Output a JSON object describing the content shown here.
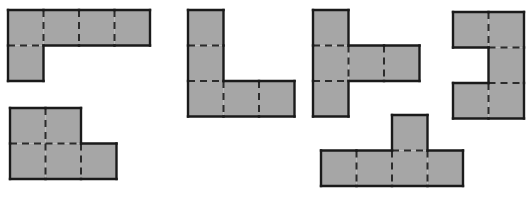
{
  "figure": {
    "background_color": "#ffffff",
    "cell_fill_color": "#a6a6a6",
    "outline_color": "#1a1a1a",
    "interior_line_color": "#2b2b2b",
    "outline_width": 2.4,
    "interior_line_width": 2.0,
    "interior_dash_pattern": "7 5",
    "cell_size": 35.5,
    "canvas": {
      "width": 532,
      "height": 197
    },
    "shape_count": 5,
    "total_cells": 25,
    "shapes": [
      {
        "id": "shape-1",
        "name": "L-pentomino-top-left",
        "label": "Shape 1",
        "cell_count": 5,
        "origin_x": 8,
        "origin_y": 10,
        "grid_cols": 4,
        "grid_rows": 2,
        "cells": [
          {
            "col": 0,
            "row": 0
          },
          {
            "col": 1,
            "row": 0
          },
          {
            "col": 2,
            "row": 0
          },
          {
            "col": 3,
            "row": 0
          },
          {
            "col": 0,
            "row": 1
          }
        ]
      },
      {
        "id": "shape-2",
        "name": "P-pentomino-bottom-left",
        "label": "Shape 2",
        "cell_count": 5,
        "origin_x": 10,
        "origin_y": 108,
        "grid_cols": 3,
        "grid_rows": 2,
        "cells": [
          {
            "col": 0,
            "row": 0
          },
          {
            "col": 1,
            "row": 0
          },
          {
            "col": 0,
            "row": 1
          },
          {
            "col": 1,
            "row": 1
          },
          {
            "col": 2,
            "row": 1
          }
        ]
      },
      {
        "id": "shape-3",
        "name": "V-pentomino-center-left",
        "label": "Shape 3",
        "cell_count": 5,
        "origin_x": 188,
        "origin_y": 10,
        "grid_cols": 3,
        "grid_rows": 3,
        "cells": [
          {
            "col": 0,
            "row": 0
          },
          {
            "col": 0,
            "row": 1
          },
          {
            "col": 0,
            "row": 2
          },
          {
            "col": 1,
            "row": 2
          },
          {
            "col": 2,
            "row": 2
          }
        ]
      },
      {
        "id": "shape-4",
        "name": "T-pentomino-center-right",
        "label": "Shape 4",
        "cell_count": 5,
        "origin_x": 313,
        "origin_y": 10,
        "grid_cols": 3,
        "grid_rows": 3,
        "cells": [
          {
            "col": 0,
            "row": 0
          },
          {
            "col": 0,
            "row": 1
          },
          {
            "col": 1,
            "row": 1
          },
          {
            "col": 2,
            "row": 1
          },
          {
            "col": 0,
            "row": 2
          }
        ]
      },
      {
        "id": "shape-5",
        "name": "C-pentomino-far-right",
        "label": "Shape 5",
        "cell_count": 5,
        "origin_x": 453,
        "origin_y": 12,
        "grid_cols": 2,
        "grid_rows": 3,
        "cells": [
          {
            "col": 0,
            "row": 0
          },
          {
            "col": 1,
            "row": 0
          },
          {
            "col": 1,
            "row": 1
          },
          {
            "col": 0,
            "row": 2
          },
          {
            "col": 1,
            "row": 2
          }
        ]
      },
      {
        "id": "shape-6",
        "name": "Y-pentomino-bottom-center",
        "label": "Shape 6",
        "cell_count": 5,
        "origin_x": 321,
        "origin_y": 115,
        "grid_cols": 4,
        "grid_rows": 2,
        "cells": [
          {
            "col": 2,
            "row": 0
          },
          {
            "col": 0,
            "row": 1
          },
          {
            "col": 1,
            "row": 1
          },
          {
            "col": 2,
            "row": 1
          },
          {
            "col": 3,
            "row": 1
          }
        ]
      }
    ]
  }
}
